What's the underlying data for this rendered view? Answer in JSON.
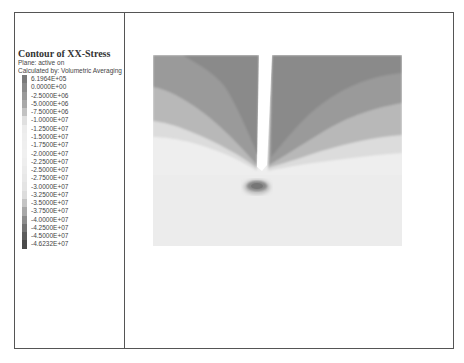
{
  "legend": {
    "title": "Contour of XX-Stress",
    "plane": "Plane: active on",
    "calc": "Calculated by: Volumetric Averaging",
    "entries": [
      {
        "label": "6.1964E+05",
        "color": "#7a7a7a"
      },
      {
        "label": "0.0000E+00",
        "color": "#8a8a8a"
      },
      {
        "label": "-2.5000E+06",
        "color": "#999999"
      },
      {
        "label": "-5.0000E+06",
        "color": "#a8a8a8"
      },
      {
        "label": "-7.5000E+06",
        "color": "#c2c2c2"
      },
      {
        "label": "-1.0000E+07",
        "color": "#e0e0e0"
      },
      {
        "label": "-1.2500E+07",
        "color": "#ececec"
      },
      {
        "label": "-1.5000E+07",
        "color": "#eeeeee"
      },
      {
        "label": "-1.7500E+07",
        "color": "#efefef"
      },
      {
        "label": "-2.0000E+07",
        "color": "#f0f0f0"
      },
      {
        "label": "-2.2500E+07",
        "color": "#eeeeee"
      },
      {
        "label": "-2.5000E+07",
        "color": "#ebebeb"
      },
      {
        "label": "-2.7500E+07",
        "color": "#e8e8e8"
      },
      {
        "label": "-3.0000E+07",
        "color": "#e4e4e4"
      },
      {
        "label": "-3.2500E+07",
        "color": "#dcdcdc"
      },
      {
        "label": "-3.5000E+07",
        "color": "#c4c4c4"
      },
      {
        "label": "-3.7500E+07",
        "color": "#a8a8a8"
      },
      {
        "label": "-4.0000E+07",
        "color": "#8c8c8c"
      },
      {
        "label": "-4.2500E+07",
        "color": "#737373"
      },
      {
        "label": "-4.5000E+07",
        "color": "#5c5c5c"
      },
      {
        "label": "-4.6232E+07",
        "color": "#4a4a4a"
      }
    ]
  },
  "chart_data": {
    "type": "heatmap",
    "title": "Contour of XX-Stress",
    "subtitle": [
      "Plane: active on",
      "Calculated by: Volumetric Averaging"
    ],
    "quantity": "XX-Stress",
    "contour_levels": [
      619640,
      0,
      -2500000,
      -5000000,
      -7500000,
      -10000000,
      -12500000,
      -15000000,
      -17500000,
      -20000000,
      -22500000,
      -25000000,
      -27500000,
      -30000000,
      -32500000,
      -35000000,
      -37500000,
      -40000000,
      -42500000,
      -45000000,
      -46232000
    ],
    "range": {
      "max": 619640,
      "min": -46232000
    },
    "legend_position": "left",
    "features": [
      {
        "name": "notch/slot",
        "description": "vertical white slot from top edge to tip near centre"
      },
      {
        "name": "stress concentration",
        "description": "dark elliptical spot below the notch tip (min ≈ -4.6E+07)"
      },
      {
        "name": "upper region",
        "description": "darker grey bands (≈ 0 to -7.5E+06) on both sides of the slot fanning down towards the tip"
      },
      {
        "name": "lower region",
        "description": "light grey (≈ -1.0E+07 to -3.0E+07)"
      }
    ]
  }
}
